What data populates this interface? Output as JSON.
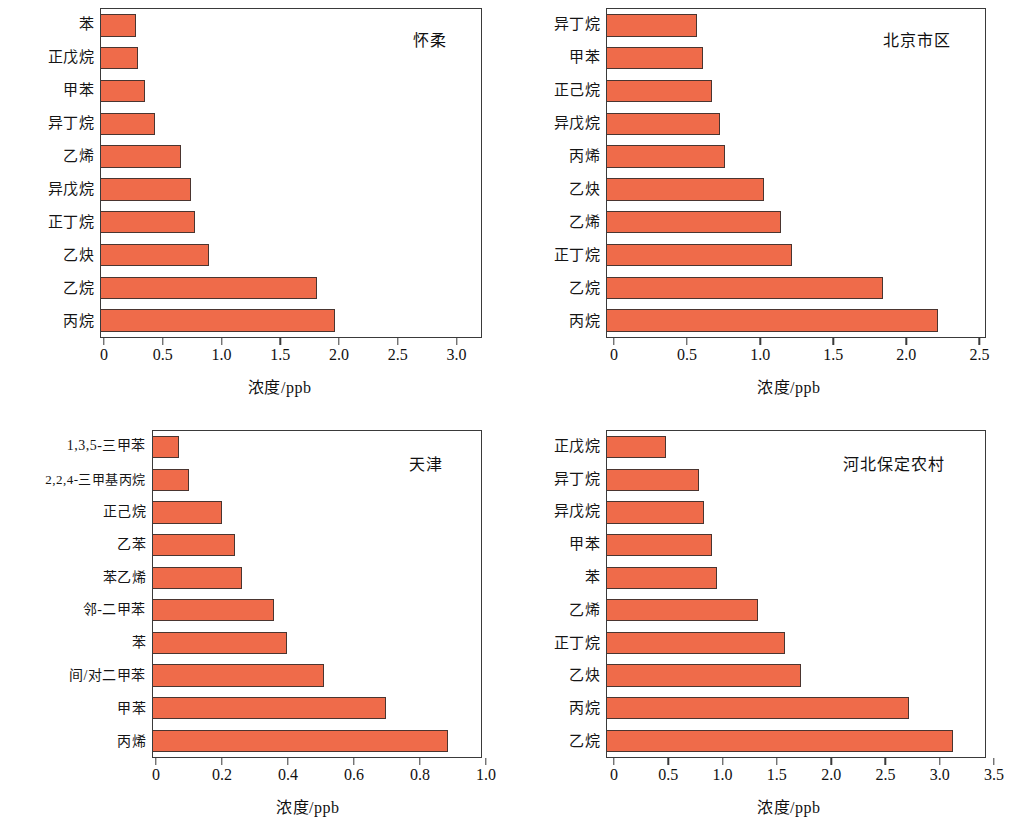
{
  "figure": {
    "bar_color": "#ef6b4a",
    "bar_border_color": "#4a3530",
    "frame_color": "#3a3a3a",
    "axis_title": "浓度/ppb"
  },
  "chart_data": [
    {
      "panel": "top-left",
      "type": "bar",
      "orientation": "horizontal",
      "title": "怀柔",
      "xlabel": "浓度/ppb",
      "ylabel": "",
      "xlim": [
        0,
        3.25
      ],
      "xticks": [
        0,
        0.5,
        1.0,
        1.5,
        2.0,
        2.5,
        3.0
      ],
      "xticklabels": [
        "0",
        "0.5",
        "1.0",
        "1.5",
        "2.0",
        "2.5",
        "3.0"
      ],
      "grid": false,
      "legend": "none",
      "categories": [
        "苯",
        "正戊烷",
        "甲苯",
        "异丁烷",
        "乙烯",
        "异戊烷",
        "正丁烷",
        "乙炔",
        "乙烷",
        "丙烷"
      ],
      "values": [
        0.3,
        0.32,
        0.38,
        0.46,
        0.68,
        0.77,
        0.8,
        0.92,
        1.85,
        2.0
      ]
    },
    {
      "panel": "top-right",
      "type": "bar",
      "orientation": "horizontal",
      "title": "北京市区",
      "xlabel": "浓度/ppb",
      "ylabel": "",
      "xlim": [
        0,
        2.6
      ],
      "xticks": [
        0,
        0.5,
        1.0,
        1.5,
        2.0,
        2.5
      ],
      "xticklabels": [
        "0",
        "0.5",
        "1.0",
        "1.5",
        "2.0",
        "2.5"
      ],
      "grid": false,
      "legend": "none",
      "categories": [
        "异丁烷",
        "甲苯",
        "正己烷",
        "异戊烷",
        "丙烯",
        "乙炔",
        "乙烯",
        "正丁烷",
        "乙烷",
        "丙烷"
      ],
      "values": [
        0.62,
        0.66,
        0.72,
        0.78,
        0.81,
        1.08,
        1.2,
        1.27,
        1.9,
        2.28
      ]
    },
    {
      "panel": "bottom-left",
      "type": "bar",
      "orientation": "horizontal",
      "title": "天津",
      "xlabel": "浓度/ppb",
      "ylabel": "",
      "xlim": [
        0,
        1.0
      ],
      "xticks": [
        0,
        0.2,
        0.4,
        0.6,
        0.8,
        1.0
      ],
      "xticklabels": [
        "0",
        "0.2",
        "0.4",
        "0.6",
        "0.8",
        "1.0"
      ],
      "grid": false,
      "legend": "none",
      "categories": [
        "1,3,5-三甲苯",
        "2,2,4-三甲基丙烷",
        "正己烷",
        "乙苯",
        "苯乙烯",
        "邻-二甲苯",
        "苯",
        "间/对二甲苯",
        "甲苯",
        "丙烯"
      ],
      "values": [
        0.08,
        0.11,
        0.21,
        0.25,
        0.27,
        0.37,
        0.41,
        0.52,
        0.71,
        0.9
      ]
    },
    {
      "panel": "bottom-right",
      "type": "bar",
      "orientation": "horizontal",
      "title": "河北保定农村",
      "xlabel": "浓度/ppb",
      "ylabel": "",
      "xlim": [
        0,
        3.5
      ],
      "xticks": [
        0,
        0.5,
        1.0,
        1.5,
        2.0,
        2.5,
        3.0,
        3.5
      ],
      "xticklabels": [
        "0",
        "0.5",
        "1.0",
        "1.5",
        "2.0",
        "2.5",
        "3.0",
        "3.5"
      ],
      "grid": false,
      "legend": "none",
      "categories": [
        "正戊烷",
        "异丁烷",
        "异戊烷",
        "甲苯",
        "苯",
        "乙烯",
        "正丁烷",
        "乙炔",
        "丙烷",
        "乙烷"
      ],
      "values": [
        0.55,
        0.85,
        0.9,
        0.97,
        1.02,
        1.4,
        1.65,
        1.8,
        2.8,
        3.2
      ]
    }
  ]
}
